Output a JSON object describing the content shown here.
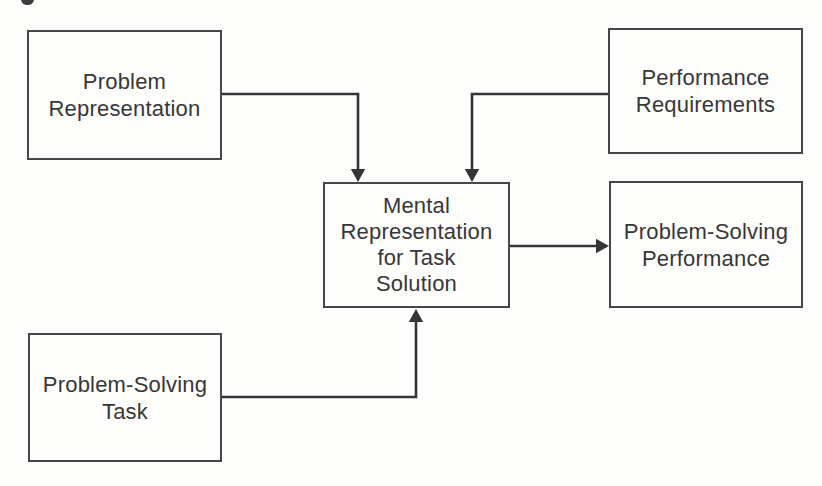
{
  "figure": {
    "colors": {
      "background": "#fdfdfc",
      "box_border": "#474747",
      "arrow": "#353535",
      "text": "#373737"
    },
    "artifact_note": "partial cropped glyph at top edge"
  },
  "diagram": {
    "nodes": [
      {
        "id": "problem-representation",
        "label": "Problem\nRepresentation"
      },
      {
        "id": "performance-requirements",
        "label": "Performance\nRequirements"
      },
      {
        "id": "mental-representation",
        "label": "Mental\nRepresentation\nfor Task\nSolution"
      },
      {
        "id": "problem-solving-performance",
        "label": "Problem-Solving\nPerformance"
      },
      {
        "id": "problem-solving-task",
        "label": "Problem-Solving\nTask"
      }
    ],
    "edges": [
      {
        "from": "problem-representation",
        "to": "mental-representation"
      },
      {
        "from": "performance-requirements",
        "to": "mental-representation"
      },
      {
        "from": "problem-solving-task",
        "to": "mental-representation"
      },
      {
        "from": "mental-representation",
        "to": "problem-solving-performance"
      }
    ]
  }
}
